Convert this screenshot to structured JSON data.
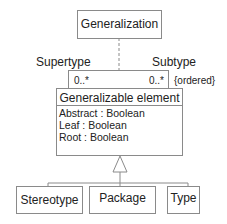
{
  "diagram": {
    "type": "UML class diagram (metamodel)",
    "association_class": {
      "name": "Generalization"
    },
    "association": {
      "role_left": "Supertype",
      "role_right": "Subtype",
      "multiplicity_left": "0..*",
      "multiplicity_right": "0..*",
      "constraint": "{ordered}"
    },
    "main_class": {
      "name": "Generalizable element",
      "attributes": [
        "Abstract : Boolean",
        "Leaf : Boolean",
        "Root : Boolean"
      ]
    },
    "subclasses": [
      {
        "name": "Stereotype"
      },
      {
        "name": "Package"
      },
      {
        "name": "Type"
      }
    ],
    "colors": {
      "line": "#8a8a8a",
      "text": "#222222",
      "background": "#ffffff"
    }
  }
}
